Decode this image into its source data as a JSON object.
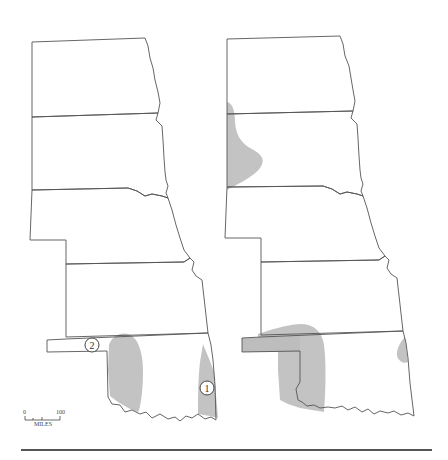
{
  "maps": [
    {
      "id": "left",
      "markers": [
        {
          "label": "1",
          "x": 207,
          "y": 388
        },
        {
          "label": "2",
          "x": 92,
          "y": 345
        }
      ]
    },
    {
      "id": "right",
      "markers": []
    }
  ],
  "scale_bar": {
    "start_label": "0",
    "end_label": "100",
    "unit_label": "MILES"
  },
  "colors": {
    "shading": "#b8b8b8",
    "boundary": "#555555",
    "background": "#ffffff"
  }
}
